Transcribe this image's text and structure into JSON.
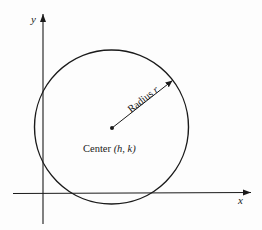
{
  "diagram": {
    "type": "circle-on-coordinate-plane",
    "axes": {
      "x_label": "x",
      "y_label": "y"
    },
    "circle": {
      "center_label_prefix": "Center ",
      "center_label_coords": "(h, k)",
      "radius_label_prefix": "Radius ",
      "radius_label_var": "r"
    },
    "colors": {
      "stroke": "#1a1a1a",
      "background": "#fdfdfd"
    }
  }
}
